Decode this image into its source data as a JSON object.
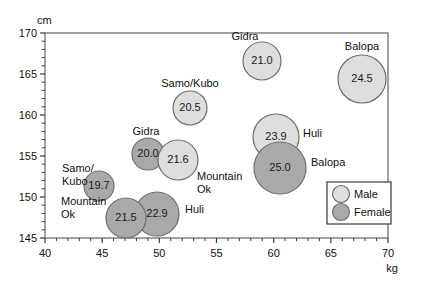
{
  "chart_data": {
    "type": "scatter",
    "title": "",
    "xlabel": "kg",
    "ylabel": "cm",
    "xlim": [
      40,
      70
    ],
    "ylim": [
      145,
      170
    ],
    "xticks": [
      "40",
      "45",
      "50",
      "55",
      "60",
      "65",
      "70"
    ],
    "yticks": [
      "145",
      "150",
      "155",
      "160",
      "165",
      "170"
    ],
    "xminor_step": 1,
    "yminor_step": 1,
    "grid": false,
    "legend": {
      "position": "bottom-right",
      "entries": [
        {
          "label": "Male",
          "color": "#dcdcdc"
        },
        {
          "label": "Female",
          "color": "#a8a8a8"
        }
      ]
    },
    "bubble_note": "bubble area/size encodes BMI value printed inside each circle",
    "points": [
      {
        "group": "Gidra",
        "sex": "Male",
        "x": 57.1,
        "y": 166.2,
        "value": "21.0",
        "label": "Gidra",
        "label_pos": "above"
      },
      {
        "group": "Balopa",
        "sex": "Male",
        "x": 65.9,
        "y": 164.1,
        "value": "24.5",
        "label": "Balopa",
        "label_pos": "above"
      },
      {
        "group": "Samo/Kubo",
        "sex": "Male",
        "x": 52.0,
        "y": 160.6,
        "value": "20.5",
        "label": "Samo/Kubo",
        "label_pos": "above"
      },
      {
        "group": "Huli",
        "sex": "Male",
        "x": 58.7,
        "y": 156.9,
        "value": "23.9",
        "label": "Huli",
        "label_pos": "right"
      },
      {
        "group": "Gidra",
        "sex": "Female",
        "x": 48.8,
        "y": 155.1,
        "value": "20.0",
        "label": "Gidra",
        "label_pos": "above"
      },
      {
        "group": "Mountain Ok",
        "sex": "Male",
        "x": 51.4,
        "y": 154.3,
        "value": "21.6",
        "label": "Mountain Ok",
        "label_pos": "below-right"
      },
      {
        "group": "Balopa",
        "sex": "Female",
        "x": 59.0,
        "y": 152.3,
        "value": "25.0",
        "label": "Balopa",
        "label_pos": "right"
      },
      {
        "group": "Samo/Kubo",
        "sex": "Female",
        "x": 44.8,
        "y": 151.6,
        "value": "19.7",
        "label": "Samo/Kubo",
        "label_pos": "left"
      },
      {
        "group": "Huli",
        "sex": "Female",
        "x": 49.6,
        "y": 148.3,
        "value": "22.9",
        "label": "Huli",
        "label_pos": "right"
      },
      {
        "group": "Mountain Ok",
        "sex": "Female",
        "x": 47.3,
        "y": 147.7,
        "value": "21.5",
        "label": "Mountain Ok",
        "label_pos": "left"
      }
    ]
  },
  "axes": {
    "y_unit": "cm",
    "x_unit": "kg",
    "y_labels": [
      "170",
      "165",
      "160",
      "155",
      "150",
      "145"
    ],
    "x_labels": [
      "40",
      "45",
      "50",
      "55",
      "60",
      "65",
      "70"
    ]
  },
  "bubbles": [
    {
      "name": "gidra-male",
      "value": "21.0",
      "cx": 262,
      "cy": 61,
      "r": 19,
      "fill": "#dedede"
    },
    {
      "name": "balopa-male",
      "value": "24.5",
      "cx": 362,
      "cy": 79,
      "r": 24,
      "fill": "#dedede"
    },
    {
      "name": "samo-kubo-male",
      "value": "20.5",
      "cx": 190,
      "cy": 108,
      "r": 17,
      "fill": "#dedede"
    },
    {
      "name": "huli-male",
      "value": "23.9",
      "cx": 276,
      "cy": 137,
      "r": 23,
      "fill": "#dedede"
    },
    {
      "name": "gidra-female",
      "value": "20.0",
      "cx": 148,
      "cy": 154,
      "r": 16,
      "fill": "#a9a9a9"
    },
    {
      "name": "mountain-ok-male",
      "value": "21.6",
      "cx": 178,
      "cy": 160,
      "r": 20,
      "fill": "#dedede"
    },
    {
      "name": "balopa-female",
      "value": "25.0",
      "cx": 280,
      "cy": 168,
      "r": 26,
      "fill": "#a9a9a9"
    },
    {
      "name": "samo-kubo-female",
      "value": "19.7",
      "cx": 99,
      "cy": 186,
      "r": 15,
      "fill": "#a9a9a9"
    },
    {
      "name": "huli-female",
      "value": "22.9",
      "cx": 157,
      "cy": 214,
      "r": 22,
      "fill": "#a9a9a9"
    },
    {
      "name": "mountain-ok-female",
      "value": "21.5",
      "cx": 126,
      "cy": 218,
      "r": 20,
      "fill": "#a9a9a9"
    }
  ],
  "annotations": [
    {
      "name": "label-gidra-male",
      "text": "Gidra",
      "x": 245,
      "y": 40,
      "anchor": "middle"
    },
    {
      "name": "label-balopa-male",
      "text": "Balopa",
      "x": 362,
      "y": 50,
      "anchor": "middle"
    },
    {
      "name": "label-samo-kubo-male",
      "text": "Samo/Kubo",
      "x": 190,
      "y": 87,
      "anchor": "middle"
    },
    {
      "name": "label-huli-male",
      "text": "Huli",
      "x": 303,
      "y": 137,
      "anchor": "start"
    },
    {
      "name": "label-gidra-female",
      "text": "Gidra",
      "x": 146,
      "y": 135,
      "anchor": "middle"
    },
    {
      "name": "label-mountain-ok-male-1",
      "text": "Mountain",
      "x": 197,
      "y": 180,
      "anchor": "start"
    },
    {
      "name": "label-mountain-ok-male-2",
      "text": "Ok",
      "x": 197,
      "y": 193,
      "anchor": "start"
    },
    {
      "name": "label-balopa-female",
      "text": "Balopa",
      "x": 311,
      "y": 166,
      "anchor": "start"
    },
    {
      "name": "label-samo-kubo-female-1",
      "text": "Samo/",
      "x": 62,
      "y": 172,
      "anchor": "start"
    },
    {
      "name": "label-samo-kubo-female-2",
      "text": "Kubo",
      "x": 62,
      "y": 185,
      "anchor": "start"
    },
    {
      "name": "label-huli-female",
      "text": "Huli",
      "x": 185,
      "y": 213,
      "anchor": "start"
    },
    {
      "name": "label-mountain-ok-female-1",
      "text": "Mountain",
      "x": 61,
      "y": 205,
      "anchor": "start"
    },
    {
      "name": "label-mountain-ok-female-2",
      "text": "Ok",
      "x": 61,
      "y": 218,
      "anchor": "start"
    }
  ],
  "legend": {
    "male_label": "Male",
    "female_label": "Female",
    "male_color": "#dedede",
    "female_color": "#a9a9a9"
  }
}
